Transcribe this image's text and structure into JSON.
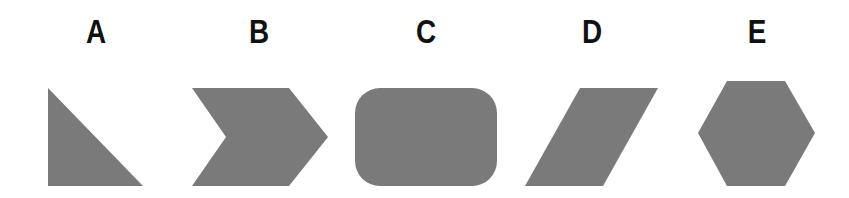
{
  "figure": {
    "fill_color": "#7a7a7a",
    "label_color": "#111111",
    "options": [
      {
        "label": "A",
        "shape": "right-triangle",
        "label_x": 96
      },
      {
        "label": "B",
        "shape": "chevron-arrow",
        "label_x": 259
      },
      {
        "label": "C",
        "shape": "rounded-rectangle",
        "label_x": 426
      },
      {
        "label": "D",
        "shape": "parallelogram",
        "label_x": 592
      },
      {
        "label": "E",
        "shape": "hexagon",
        "label_x": 757
      }
    ]
  }
}
